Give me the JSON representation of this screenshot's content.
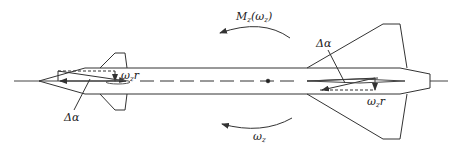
{
  "diagram": {
    "labels": {
      "moment": "M",
      "moment_sub": "z",
      "moment_arg": "(ω",
      "moment_arg_sub": "z",
      "moment_close": ")",
      "omega_bottom": "ω",
      "omega_bottom_sub": "z",
      "delta_alpha_left": "Δα",
      "delta_alpha_right": "Δα",
      "omega_r_left": "ω",
      "omega_r_left_sub": "z",
      "omega_r_left_r": "r",
      "omega_r_right": "ω",
      "omega_r_right_sub": "z",
      "omega_r_right_r": "r"
    },
    "colors": {
      "stroke": "#333333",
      "background": "#ffffff"
    }
  }
}
